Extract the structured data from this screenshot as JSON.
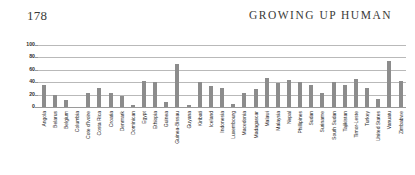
{
  "page": {
    "folio": "178",
    "running_head": "GROWING UP HUMAN"
  },
  "chart_data": {
    "type": "bar",
    "title": "",
    "xlabel": "",
    "ylabel": "",
    "ylim": [
      0,
      100
    ],
    "yticks": [
      100,
      80,
      60,
      40,
      20,
      0
    ],
    "grid": true,
    "legend": "none",
    "bar_color": "#8c8c8c",
    "categories": [
      "Angola",
      "Belarus",
      "Belgium",
      "Columbia",
      "Cote d'Ivoire",
      "Costa Rica",
      "Croatia",
      "Denmark",
      "Dominican",
      "Egypt",
      "Ethiopia",
      "Guinea",
      "Guinea-Bissau",
      "Guyana",
      "Kiribati",
      "Iceland",
      "Indonesia",
      "Luxembourg",
      "Macedonia",
      "Madagascar",
      "Malawi",
      "Malaysia",
      "Nepal",
      "Phillipines",
      "Sudan",
      "Suriname",
      "South Sudan",
      "Tajikistan",
      "Timor-Leste",
      "Turkey",
      "United States",
      "Vanuatu",
      "Zimbabwe"
    ],
    "values": [
      36,
      20,
      11,
      0,
      22,
      31,
      22,
      17,
      4,
      42,
      41,
      8,
      70,
      3,
      40,
      34,
      30,
      5,
      22,
      29,
      47,
      38,
      44,
      40,
      35,
      22,
      40,
      36,
      45,
      30,
      13,
      75,
      42
    ]
  }
}
